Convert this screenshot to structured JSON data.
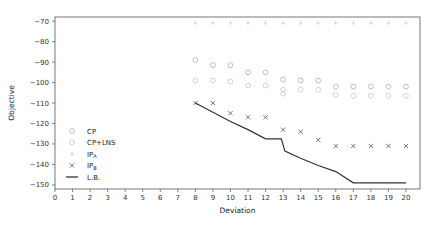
{
  "figure": {
    "background": "#ffffff",
    "frame_color": "#555555",
    "width": 436,
    "height": 226
  },
  "chart_data": {
    "type": "scatter",
    "title": "",
    "xlabel": "Deviation",
    "ylabel": "Objective",
    "xlim": [
      0,
      20.8
    ],
    "ylim": [
      -152,
      -68
    ],
    "xticks": [
      0,
      1,
      2,
      3,
      4,
      5,
      6,
      7,
      8,
      9,
      10,
      11,
      12,
      13,
      14,
      15,
      16,
      17,
      18,
      19,
      20
    ],
    "xticklabels": [
      "0",
      "1",
      "2",
      "3",
      "4",
      "5",
      "6",
      "7",
      "8",
      "9",
      "10",
      "11",
      "12",
      "13",
      "14",
      "15",
      "16",
      "17",
      "18",
      "19",
      "20"
    ],
    "yticks": [
      -70,
      -80,
      -90,
      -100,
      -110,
      -120,
      -130,
      -140,
      -150
    ],
    "yticklabels": [
      "−70",
      "−80",
      "−90",
      "−100",
      "−110",
      "−120",
      "−130",
      "−140",
      "−150"
    ],
    "grid": false,
    "legend_position": "lower-left-inside",
    "series": [
      {
        "name": "CP",
        "marker": "circle-open",
        "color": "#b0b0b0",
        "x": [
          8,
          9,
          10,
          11,
          12,
          13,
          14,
          15,
          16,
          17,
          18,
          19,
          20
        ],
        "y": [
          -89,
          -91.5,
          -91.5,
          -95,
          -95,
          -98.5,
          -99,
          -99,
          -102,
          -102,
          -102,
          -102,
          -102
        ]
      },
      {
        "name": "CP+LNS",
        "marker": "circle-open",
        "color": "#c8c8c8",
        "x": [
          8,
          9,
          10,
          11,
          12,
          13,
          13,
          14,
          15,
          16,
          17,
          18,
          19,
          20
        ],
        "y": [
          -99,
          -99,
          -99.5,
          -101.5,
          -101.5,
          -103.5,
          -105.5,
          -103.5,
          -103.5,
          -106,
          -106.5,
          -106.5,
          -106.5,
          -106.5
        ]
      },
      {
        "name": "IPᴀ",
        "marker": "plus",
        "color": "#cccccc",
        "x": [
          8,
          9,
          10,
          11,
          12,
          13,
          14,
          15,
          16,
          17,
          18,
          19,
          20
        ],
        "y": [
          -71,
          -71,
          -71,
          -71,
          -71,
          -71,
          -71,
          -71,
          -71,
          -71,
          -71,
          -71,
          -71
        ]
      },
      {
        "name": "IPʙ",
        "marker": "x",
        "color": "#666666",
        "x": [
          8,
          9,
          10,
          11,
          12,
          13,
          14,
          15,
          16,
          17,
          18,
          19,
          20
        ],
        "y": [
          -110,
          -110,
          -115,
          -117,
          -117,
          -123,
          -124,
          -128,
          -131,
          -131,
          -131,
          -131,
          -131
        ]
      },
      {
        "name": "L.B.",
        "marker": "line",
        "color": "#333333",
        "x": [
          8,
          9,
          10,
          11,
          12,
          12.9,
          13.1,
          14,
          15,
          16,
          17,
          18,
          19,
          20
        ],
        "y": [
          -110,
          -114.5,
          -119,
          -123,
          -127.5,
          -127.5,
          -133.5,
          -137,
          -140.5,
          -143.5,
          -149,
          -149,
          -149,
          -149
        ]
      }
    ],
    "legend_entries": [
      {
        "label": "CP",
        "marker": "circle-open"
      },
      {
        "label": "CP+LNS",
        "marker": "circle-open"
      },
      {
        "label": "IP",
        "sub": "A",
        "marker": "plus"
      },
      {
        "label": "IP",
        "sub": "B",
        "marker": "x"
      },
      {
        "label": "L.B.",
        "marker": "line"
      }
    ]
  }
}
